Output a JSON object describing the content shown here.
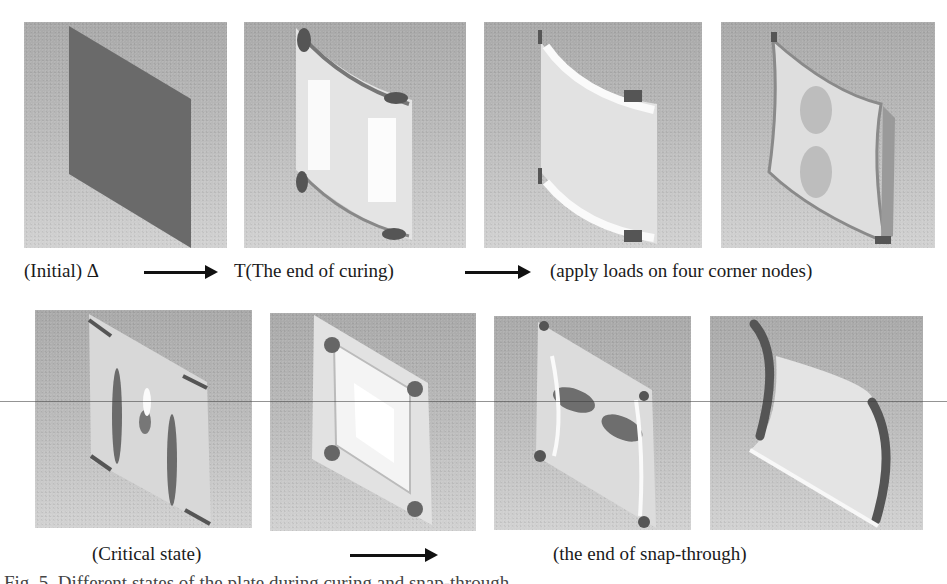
{
  "figure": {
    "rows": [
      {
        "panels": [
          {
            "id": "initial",
            "state": "flat plate"
          },
          {
            "id": "cured",
            "state": "cylindrical after curing"
          },
          {
            "id": "load-1",
            "state": "curved, loads applied"
          },
          {
            "id": "load-2",
            "state": "deformed under corner loads"
          }
        ],
        "labels": {
          "initial": "(Initial) Δ",
          "cured": "T(The end of curing)",
          "loads": "(apply loads on four corner nodes)"
        }
      },
      {
        "panels": [
          {
            "id": "critical-1",
            "state": "critical state"
          },
          {
            "id": "critical-2",
            "state": "transition"
          },
          {
            "id": "snap-1",
            "state": "snapping"
          },
          {
            "id": "snap-2",
            "state": "end of snap-through"
          }
        ],
        "labels": {
          "critical": "(Critical state)",
          "snap": "(the end of snap-through)"
        }
      }
    ],
    "caption": "Fig. 5. Different states of the plate during curing and snap-through"
  }
}
